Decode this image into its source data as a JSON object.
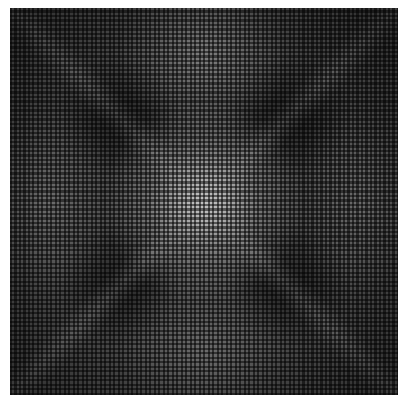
{
  "image": {
    "description": "Abstract grayscale op-art grid pattern with moiré-like bright center and diagonal X structure",
    "colors": {
      "background": "#ffffff",
      "dark": "#1e1e1e",
      "mid": "#4a4a4a",
      "light": "#e6e6e6"
    }
  }
}
